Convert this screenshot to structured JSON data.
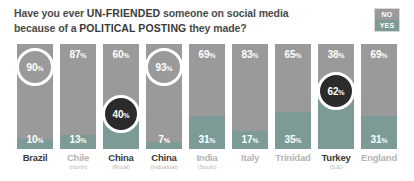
{
  "header": {
    "line1_prefix": "Have you ever ",
    "line1_strong": "UN-FRIENDED",
    "line1_suffix": " someone on social media",
    "line2_prefix": "because of a ",
    "line2_strong": "POLITICAL POSTING",
    "line2_suffix": " they made?"
  },
  "legend": {
    "no_label": "NO",
    "yes_label": "YES",
    "no_color": "#9a9a9a",
    "yes_color": "#7d9b96"
  },
  "chart_data": {
    "type": "bar",
    "title": "Have you ever UN-FRIENDED someone on social media because of a POLITICAL POSTING they made?",
    "xlabel": "",
    "ylabel": "",
    "ylim": [
      0,
      100
    ],
    "grid": false,
    "legend_position": "top-right",
    "stacked": true,
    "categories": [
      "Brazil",
      "Chile (North)",
      "China (Rural)",
      "China (Industrial)",
      "India (South)",
      "Italy",
      "Trinidad",
      "Turkey (S.E)",
      "England"
    ],
    "series": [
      {
        "name": "NO",
        "values": [
          90,
          87,
          60,
          93,
          69,
          83,
          65,
          38,
          69
        ]
      },
      {
        "name": "YES",
        "values": [
          10,
          13,
          40,
          7,
          31,
          17,
          35,
          62,
          31
        ]
      }
    ]
  },
  "bars": [
    {
      "country": "Brazil",
      "sub": "",
      "country_style": "dark",
      "no_value": 90,
      "no_label": "90",
      "yes_value": 10,
      "yes_label": "10",
      "pct_symbol": "%",
      "highlight": "no",
      "highlight_style": "light"
    },
    {
      "country": "Chile",
      "sub": "(North)",
      "country_style": "light",
      "no_value": 87,
      "no_label": "87",
      "yes_value": 13,
      "yes_label": "13",
      "pct_symbol": "%",
      "highlight": "none",
      "highlight_style": ""
    },
    {
      "country": "China",
      "sub": "(Rural)",
      "country_style": "dark",
      "no_value": 60,
      "no_label": "60",
      "yes_value": 40,
      "yes_label": "40",
      "pct_symbol": "%",
      "highlight": "yes",
      "highlight_style": "dark"
    },
    {
      "country": "China",
      "sub": "(Industrial)",
      "country_style": "dark",
      "no_value": 93,
      "no_label": "93",
      "yes_value": 7,
      "yes_label": "7",
      "pct_symbol": "%",
      "highlight": "no",
      "highlight_style": "light"
    },
    {
      "country": "India",
      "sub": "(South)",
      "country_style": "light",
      "no_value": 69,
      "no_label": "69",
      "yes_value": 31,
      "yes_label": "31",
      "pct_symbol": "%",
      "highlight": "none",
      "highlight_style": ""
    },
    {
      "country": "Italy",
      "sub": "",
      "country_style": "light",
      "no_value": 83,
      "no_label": "83",
      "yes_value": 17,
      "yes_label": "17",
      "pct_symbol": "%",
      "highlight": "none",
      "highlight_style": ""
    },
    {
      "country": "Trinidad",
      "sub": "",
      "country_style": "light",
      "no_value": 65,
      "no_label": "65",
      "yes_value": 35,
      "yes_label": "35",
      "pct_symbol": "%",
      "highlight": "none",
      "highlight_style": ""
    },
    {
      "country": "Turkey",
      "sub": "(S.E)",
      "country_style": "dark",
      "no_value": 38,
      "no_label": "38",
      "yes_value": 62,
      "yes_label": "62",
      "pct_symbol": "%",
      "highlight": "yes",
      "highlight_style": "dark"
    },
    {
      "country": "England",
      "sub": "",
      "country_style": "light",
      "no_value": 69,
      "no_label": "69",
      "yes_value": 31,
      "yes_label": "31",
      "pct_symbol": "%",
      "highlight": "none",
      "highlight_style": ""
    }
  ]
}
